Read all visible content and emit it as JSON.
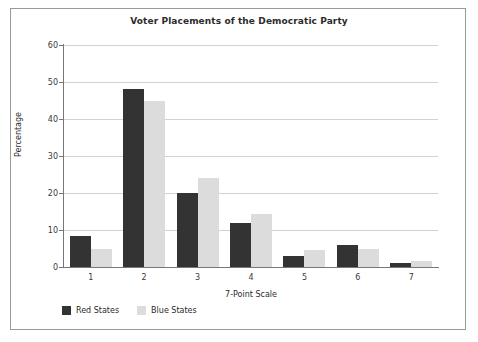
{
  "chart_data": {
    "type": "bar",
    "title": "Voter Placements of the Democratic Party",
    "xlabel": "7-Point Scale",
    "ylabel": "Percentage",
    "categories": [
      "1",
      "2",
      "3",
      "4",
      "5",
      "6",
      "7"
    ],
    "series": [
      {
        "name": "Red States",
        "color": "#333333",
        "values": [
          8.5,
          48,
          20,
          12,
          3,
          6,
          1
        ]
      },
      {
        "name": "Blue States",
        "color": "#dcdcdc",
        "values": [
          5,
          45,
          24,
          14.3,
          4.5,
          5,
          1.5
        ]
      }
    ],
    "ylim": [
      0,
      60
    ],
    "yticks": [
      0,
      10,
      20,
      30,
      40,
      50,
      60
    ],
    "ytick_labels": [
      "0",
      "10",
      "20",
      "30",
      "40",
      "50",
      "60"
    ],
    "grid": "horizontal",
    "legend_position": "below-axis-left"
  },
  "figure": {
    "border_color": "#9a9a9a",
    "background": "#ffffff",
    "axis_color": "#777777",
    "gridline_color": "#d2d2d2"
  }
}
